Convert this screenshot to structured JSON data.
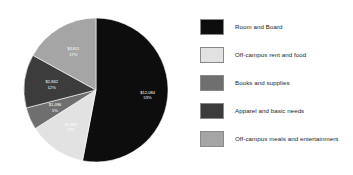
{
  "chart_data": {
    "type": "pie",
    "title": "",
    "categories": [
      "Room and Board",
      "Off-campus rent and food",
      "Books and supplies",
      "Apparel and basic needs",
      "Off-campus meals and entertainment"
    ],
    "values": [
      12084,
      2965,
      1096,
      2842,
      3811
    ],
    "percentages": [
      53,
      13,
      5,
      12,
      17
    ],
    "value_labels": [
      "$12,084",
      "$2,965",
      "$1,096",
      "$2,842",
      "$3,811"
    ],
    "percent_labels": [
      "53%",
      "13%",
      "5%",
      "12%",
      "17%"
    ],
    "colors": [
      "#0d0d0d",
      "#e2e2e2",
      "#6f6f6f",
      "#3c3c3c",
      "#a5a5a5"
    ],
    "label_text_colors": [
      "#ffffff",
      "#ffffff",
      "#ffffff",
      "#ffffff",
      "#ffffff"
    ],
    "legend_position": "right",
    "grid": false,
    "xlabel": "",
    "ylabel": ""
  },
  "legend": {
    "items": [
      {
        "label": "Room and Board",
        "color": "#0d0d0d"
      },
      {
        "label": "Off-campus rent and food",
        "color": "#e2e2e2"
      },
      {
        "label": "Books and supplies",
        "color": "#6f6f6f"
      },
      {
        "label": "Apparel and basic needs",
        "color": "#3c3c3c"
      },
      {
        "label": "Off-campus meals and entertainment",
        "color": "#a5a5a5"
      }
    ]
  },
  "slices": [
    {
      "name": "room-and-board",
      "value_label": "$12,084",
      "percent_label": "53%"
    },
    {
      "name": "off-campus-rent-and-food",
      "value_label": "$2,965",
      "percent_label": "13%"
    },
    {
      "name": "books-and-supplies",
      "value_label": "$1,096",
      "percent_label": "5%"
    },
    {
      "name": "apparel-and-basic-needs",
      "value_label": "$2,842",
      "percent_label": "12%"
    },
    {
      "name": "off-campus-meals-and-entertainment",
      "value_label": "$3,811",
      "percent_label": "17%"
    }
  ]
}
